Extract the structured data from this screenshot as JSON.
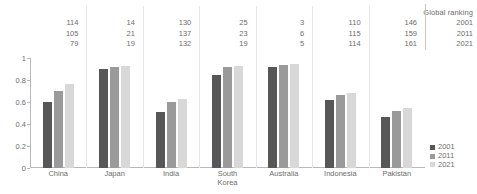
{
  "ranking_table": {
    "header": "Global ranking",
    "years": [
      "2001",
      "2011",
      "2021"
    ],
    "columns": [
      {
        "country": "China",
        "values": [
          "114",
          "105",
          "79"
        ]
      },
      {
        "country": "Japan",
        "values": [
          "14",
          "21",
          "19"
        ]
      },
      {
        "country": "India",
        "values": [
          "130",
          "137",
          "132"
        ]
      },
      {
        "country": "South Korea",
        "values": [
          "25",
          "23",
          "19"
        ]
      },
      {
        "country": "Australia",
        "values": [
          "3",
          "6",
          "5"
        ]
      },
      {
        "country": "Indonesia",
        "values": [
          "110",
          "115",
          "114"
        ]
      },
      {
        "country": "Pakistan",
        "values": [
          "146",
          "159",
          "161"
        ]
      }
    ]
  },
  "legend": {
    "items": [
      {
        "label": "2001",
        "color": "#575757"
      },
      {
        "label": "2011",
        "color": "#9a9a9a"
      },
      {
        "label": "2021",
        "color": "#d8d8d8"
      }
    ]
  },
  "chart_data": {
    "type": "bar",
    "title": "",
    "xlabel": "",
    "ylabel": "",
    "ylim": [
      0,
      1
    ],
    "yticks": [
      "0",
      "0.2",
      "0.4",
      "0.6",
      "0.8",
      "1"
    ],
    "ytick_values": [
      0,
      0.2,
      0.4,
      0.6,
      0.8,
      1
    ],
    "grid": false,
    "legend_position": "right",
    "categories": [
      "China",
      "Japan",
      "India",
      "South\nKorea",
      "Australia",
      "Indonesia",
      "Pakistan"
    ],
    "series": [
      {
        "name": "2001",
        "color": "#575757",
        "values": [
          0.6,
          0.9,
          0.51,
          0.85,
          0.92,
          0.62,
          0.46
        ]
      },
      {
        "name": "2011",
        "color": "#9a9a9a",
        "values": [
          0.7,
          0.92,
          0.6,
          0.92,
          0.94,
          0.66,
          0.52
        ]
      },
      {
        "name": "2021",
        "color": "#d8d8d8",
        "values": [
          0.76,
          0.93,
          0.63,
          0.93,
          0.95,
          0.68,
          0.55
        ]
      }
    ]
  }
}
